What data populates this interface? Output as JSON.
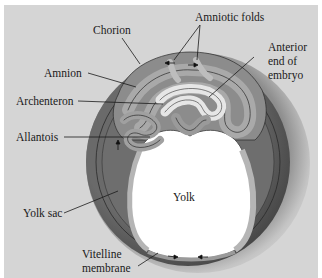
{
  "diagram": {
    "type": "anatomical-cross-section",
    "colors": {
      "background": "#d5d5d5",
      "outer_shell": "#b8b8b8",
      "chorion_dark": "#5a5a5a",
      "amnion_layer": "#8a8a8a",
      "yolk": "#ffffff",
      "line": "#1a1a1a"
    },
    "labels": {
      "chorion": "Chorion",
      "amniotic_folds": "Amniotic folds",
      "amnion": "Amnion",
      "anterior_end_1": "Anterior",
      "anterior_end_2": "end of",
      "anterior_end_3": "embryo",
      "archenteron": "Archenteron",
      "allantois": "Allantois",
      "yolk": "Yolk",
      "yolk_sac": "Yolk sac",
      "vitelline_1": "Vitelline",
      "vitelline_2": "membrane"
    }
  }
}
